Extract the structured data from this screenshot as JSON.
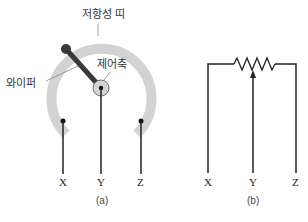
{
  "panel_a": {
    "labels": {
      "resistive_band": "저항성 띠",
      "wiper": "와이퍼",
      "shaft": "제어축"
    },
    "terminals": [
      "X",
      "Y",
      "Z"
    ],
    "caption": "(a)"
  },
  "panel_b": {
    "terminals": [
      "X",
      "Y",
      "Z"
    ],
    "caption": "(b)"
  },
  "colors": {
    "band": "#d3d3d3",
    "wire": "#222222",
    "wiper": "#3a3a3a"
  }
}
